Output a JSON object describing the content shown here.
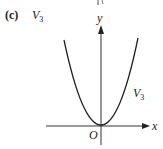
{
  "figure": {
    "caption_label": "(c)",
    "caption_var": "V",
    "caption_var_sub": "3",
    "axes": {
      "x_label": "x",
      "y_label": "y",
      "origin_label": "O"
    },
    "curve": {
      "name": "V",
      "name_sub": "3",
      "shape": "parabola",
      "vertex": "origin",
      "opens": "up"
    },
    "colors": {
      "ink": "#222222",
      "background": "#ffffff"
    }
  }
}
